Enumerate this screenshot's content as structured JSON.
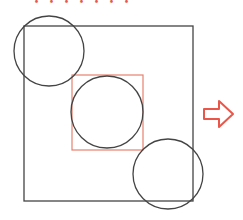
{
  "caption": "・・・・・・・",
  "colors": {
    "stroke": "#444444",
    "accent": "#e8574a"
  },
  "diagram": {
    "outer_square": {
      "x": 24,
      "y": 26,
      "w": 169,
      "h": 175
    },
    "inner_square": {
      "x": 72,
      "y": 75,
      "w": 71,
      "h": 75
    },
    "circles": [
      {
        "cx": 49,
        "cy": 51,
        "r": 35
      },
      {
        "cx": 107,
        "cy": 112,
        "r": 36
      },
      {
        "cx": 168,
        "cy": 174,
        "r": 35
      }
    ],
    "arrow": {
      "direction": "right"
    }
  }
}
